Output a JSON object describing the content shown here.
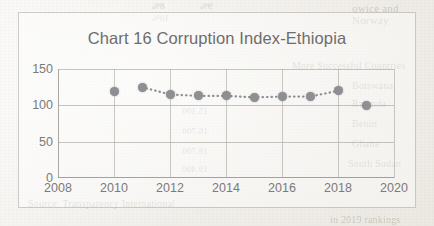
{
  "document": {
    "type": "scanned-page-with-chart",
    "bleed_text": [
      {
        "text": "owice and",
        "x": 352,
        "y": 2,
        "size": 11,
        "mirror": false
      },
      {
        "text": "Norway",
        "x": 352,
        "y": 14,
        "size": 11,
        "mirror": false
      },
      {
        "text": "8%",
        "x": 152,
        "y": 1,
        "size": 9,
        "mirror": true
      },
      {
        "text": "9%",
        "x": 200,
        "y": 1,
        "size": 9,
        "mirror": true
      },
      {
        "text": "10%",
        "x": 152,
        "y": 13,
        "size": 9,
        "mirror": true
      },
      {
        "text": "More Successful Countries",
        "x": 292,
        "y": 60,
        "size": 10,
        "mirror": false
      },
      {
        "text": "Botswana",
        "x": 352,
        "y": 80,
        "size": 10,
        "mirror": false
      },
      {
        "text": "Rwanda",
        "x": 352,
        "y": 98,
        "size": 10,
        "mirror": false
      },
      {
        "text": "Benin",
        "x": 352,
        "y": 118,
        "size": 10,
        "mirror": false
      },
      {
        "text": "Ghana",
        "x": 352,
        "y": 138,
        "size": 10,
        "mirror": false
      },
      {
        "text": "South Sudan",
        "x": 348,
        "y": 158,
        "size": 10,
        "mirror": false
      },
      {
        "text": "15.100",
        "x": 182,
        "y": 106,
        "size": 9,
        "mirror": true
      },
      {
        "text": "16.700",
        "x": 182,
        "y": 126,
        "size": 9,
        "mirror": true
      },
      {
        "text": "18.700",
        "x": 182,
        "y": 146,
        "size": 9,
        "mirror": true
      },
      {
        "text": "19.400",
        "x": 182,
        "y": 164,
        "size": 9,
        "mirror": true
      },
      {
        "text": "Source: Transparency International",
        "x": 28,
        "y": 198,
        "size": 10,
        "mirror": false
      },
      {
        "text": "in 2019 rankings",
        "x": 330,
        "y": 214,
        "size": 10,
        "mirror": false
      }
    ]
  },
  "chart_data": {
    "type": "line",
    "title": "Chart 16 Corruption Index-Ethiopia",
    "xlabel": "",
    "ylabel": "",
    "x": [
      2010,
      2011,
      2012,
      2013,
      2014,
      2015,
      2016,
      2017,
      2018,
      2019
    ],
    "values": [
      119,
      125,
      115,
      113,
      113,
      111,
      112,
      112,
      120,
      100
    ],
    "series": [
      {
        "name": "Corruption Index-Ethiopia",
        "values": [
          119,
          125,
          115,
          113,
          113,
          111,
          112,
          112,
          120,
          100
        ]
      }
    ],
    "xlim": [
      2008,
      2020
    ],
    "ylim": [
      0,
      150
    ],
    "x_ticks": [
      "2008",
      "2010",
      "2012",
      "2014",
      "2016",
      "2018",
      "2020"
    ],
    "x_tick_values": [
      2008,
      2010,
      2012,
      2014,
      2016,
      2018,
      2020
    ],
    "y_ticks": [
      "0",
      "50",
      "100",
      "150"
    ],
    "y_tick_values": [
      0,
      50,
      100,
      150
    ],
    "grid": true,
    "legend": false,
    "line_style": "dotted",
    "marker": "circle",
    "series_color": "#8d8f92",
    "grid_color": "#aaa69e",
    "title_color": "#6d6d6d",
    "tick_color": "#7a7a7a"
  }
}
